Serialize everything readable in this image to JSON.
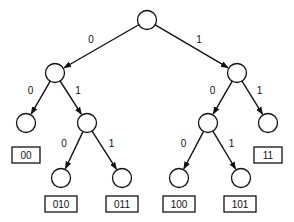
{
  "diagram": {
    "type": "binary-tree",
    "nodes": [
      {
        "id": "root"
      },
      {
        "id": "n0"
      },
      {
        "id": "n1"
      },
      {
        "id": "n00"
      },
      {
        "id": "n01"
      },
      {
        "id": "n10"
      },
      {
        "id": "n11"
      },
      {
        "id": "n010"
      },
      {
        "id": "n011"
      },
      {
        "id": "n100"
      },
      {
        "id": "n101"
      }
    ],
    "edges": [
      {
        "from": "root",
        "to": "n0",
        "label": "0"
      },
      {
        "from": "root",
        "to": "n1",
        "label": "1"
      },
      {
        "from": "n0",
        "to": "n00",
        "label": "0"
      },
      {
        "from": "n0",
        "to": "n01",
        "label": "1"
      },
      {
        "from": "n1",
        "to": "n10",
        "label": "0"
      },
      {
        "from": "n1",
        "to": "n11",
        "label": "1"
      },
      {
        "from": "n01",
        "to": "n010",
        "label": "0"
      },
      {
        "from": "n01",
        "to": "n011",
        "label": "1"
      },
      {
        "from": "n10",
        "to": "n100",
        "label": "0"
      },
      {
        "from": "n10",
        "to": "n101",
        "label": "1"
      }
    ],
    "leaf_codes": [
      {
        "node": "n00",
        "code": "00"
      },
      {
        "node": "n11",
        "code": "11"
      },
      {
        "node": "n010",
        "code": "010"
      },
      {
        "node": "n011",
        "code": "011"
      },
      {
        "node": "n100",
        "code": "100"
      },
      {
        "node": "n101",
        "code": "101"
      }
    ]
  }
}
